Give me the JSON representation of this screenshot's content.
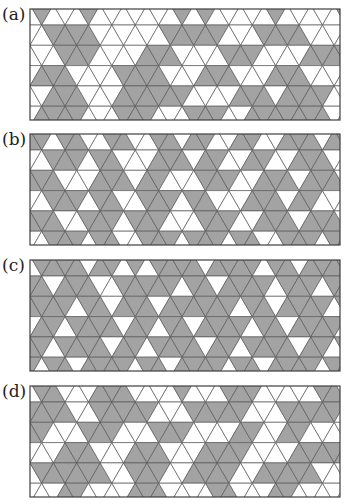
{
  "figure": {
    "colors": {
      "fill": "#a3a3a3",
      "empty": "#ffffff",
      "line": "#5a5a5a",
      "border": "#3f3f3f"
    },
    "geometry": {
      "side": 23.4,
      "row_height": 20.3,
      "first_line_offset": 16,
      "width": 310,
      "height": 111
    },
    "panels": [
      {
        "label": "(a)",
        "top": 8,
        "rows": [
          "0100010000000101000001000001",
          "0011110000001111100011110000",
          "0001110000111000011100001111",
          "0111000011110001110001110000",
          "0011100011111100001110111100",
          "0111100011100011100111111100"
        ]
      },
      {
        "label": "(b)",
        "top": 133,
        "rows": [
          "1101100110011011001100111011",
          "0011101100011101100110011100",
          "1110001110110001110011101110",
          "0011101100111011000111011000",
          "1110011101110001110011101110",
          "0011101100111011101100111011"
        ]
      },
      {
        "label": "(c)",
        "top": 259,
        "rows": [
          "0111101101011110111101101111",
          "1101110011111011011110111011",
          "1111011011101111110110111101",
          "0110111101101101111011011110",
          "1101111011011110110111101101",
          "1011011110110111101101111011"
        ]
      },
      {
        "label": "(d)",
        "top": 385,
        "rows": [
          "0110001110000100011100000110",
          "1111001111100011111000111110",
          "1100011100011100001100110000",
          "0001110001110001111000011111",
          "0111111001110011110011111000",
          "0001100001110000110001100000"
        ]
      }
    ]
  }
}
